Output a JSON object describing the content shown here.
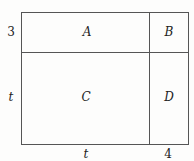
{
  "diagram": {
    "regions": [
      {
        "id": "A",
        "label": "A"
      },
      {
        "id": "B",
        "label": "B"
      },
      {
        "id": "C",
        "label": "C"
      },
      {
        "id": "D",
        "label": "D"
      }
    ],
    "left_labels": [
      "3",
      "t"
    ],
    "bottom_labels": [
      "t",
      "4"
    ]
  }
}
